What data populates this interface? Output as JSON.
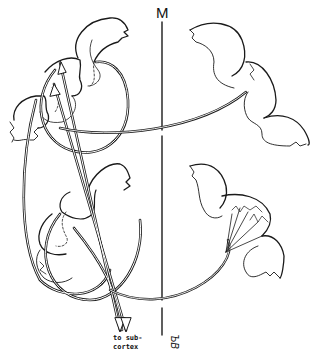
{
  "diagram": {
    "midline_label": "M",
    "output_label_line1": "to sub-",
    "output_label_line2": "cortex",
    "signature": "ЪВ",
    "colors": {
      "ink": "#1a1a1a",
      "paper": "#ffffff"
    },
    "left_hemisphere": {
      "upper_gyri": 3,
      "lower_gyri": 2,
      "description": "cortical gyri with pyramidal neurons projecting descending axons"
    },
    "right_hemisphere": {
      "upper_gyri": 2,
      "lower_gyri": 2,
      "description": "callosal fibres terminating in contralateral cortex"
    }
  }
}
